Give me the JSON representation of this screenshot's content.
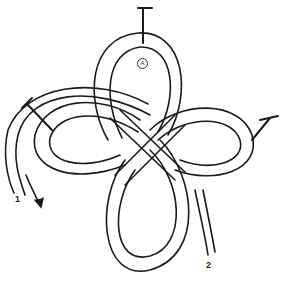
{
  "diagram": {
    "type": "knot-illustration",
    "labels": {
      "top_loop_marker": "A",
      "end_1": "1",
      "end_2": "2"
    },
    "loops": [
      "top",
      "left",
      "right",
      "bottom"
    ],
    "markers": [
      "top-tick",
      "left-tick",
      "right-tick"
    ],
    "colors": {
      "stroke": "#1a1a1a",
      "background": "#ffffff"
    }
  }
}
